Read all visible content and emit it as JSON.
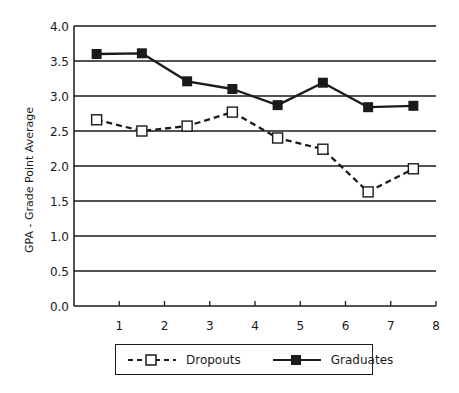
{
  "chart_data": {
    "type": "line",
    "title": "",
    "xlabel": "",
    "ylabel": "GPA - Grade Point Average",
    "xlim": [
      0,
      8
    ],
    "ylim": [
      0.0,
      4.0
    ],
    "x_ticks": [
      "1",
      "2",
      "3",
      "4",
      "5",
      "6",
      "7",
      "8"
    ],
    "y_ticks": [
      "0.0",
      "0.5",
      "1.0",
      "1.5",
      "2.0",
      "2.5",
      "3.0",
      "3.5",
      "4.0"
    ],
    "grid": "horizontal",
    "legend_position": "bottom",
    "x": [
      0.5,
      1.5,
      2.5,
      3.5,
      4.5,
      5.5,
      6.5,
      7.5
    ],
    "series": [
      {
        "name": "Dropouts",
        "style": "dashed",
        "marker": "open-square",
        "color": "#1a1a1a",
        "values": [
          2.66,
          2.5,
          2.57,
          2.77,
          2.4,
          2.24,
          1.63,
          1.96
        ]
      },
      {
        "name": "Graduates",
        "style": "solid",
        "marker": "filled-square",
        "color": "#1a1a1a",
        "values": [
          3.6,
          3.61,
          3.21,
          3.1,
          2.87,
          3.19,
          2.84,
          2.86
        ]
      }
    ]
  },
  "legend": {
    "dropouts_label": "Dropouts",
    "graduates_label": "Graduates"
  },
  "colors": {
    "ink": "#1a1a1a",
    "background": "#ffffff"
  }
}
